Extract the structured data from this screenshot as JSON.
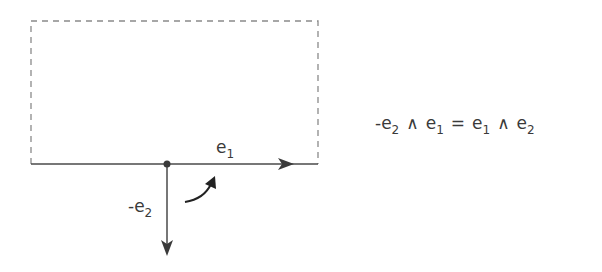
{
  "diagram": {
    "rectangle": {
      "style": "dashed",
      "x": 31,
      "y": 21,
      "width": 287,
      "height": 143
    },
    "origin": {
      "x": 167,
      "y": 164
    },
    "vectors": [
      {
        "label": "e",
        "subscript": "1",
        "direction": "right"
      },
      {
        "label": "-e",
        "subscript": "2",
        "direction": "down"
      }
    ],
    "rotation_arrow": {
      "direction": "counter-clockwise",
      "from": "-e2",
      "to": "e1"
    },
    "colors": {
      "stroke": "#4a4a4a",
      "dash": "#8a8a8a",
      "text": "#3a3a3a"
    }
  },
  "labels": {
    "e1": {
      "base": "e",
      "sub": "1"
    },
    "neg_e2": {
      "base": "-e",
      "sub": "2"
    }
  },
  "equation": {
    "lhs": [
      {
        "base": "-e",
        "sub": "2"
      },
      {
        "op": "∧"
      },
      {
        "base": "e",
        "sub": "1"
      }
    ],
    "equals": "=",
    "rhs": [
      {
        "base": "e",
        "sub": "1"
      },
      {
        "op": "∧"
      },
      {
        "base": "e",
        "sub": "2"
      }
    ],
    "wedge": "∧",
    "lhs_t1_base": "-e",
    "lhs_t1_sub": "2",
    "lhs_t2_base": "e",
    "lhs_t2_sub": "1",
    "rhs_t1_base": "e",
    "rhs_t1_sub": "1",
    "rhs_t2_base": "e",
    "rhs_t2_sub": "2"
  }
}
